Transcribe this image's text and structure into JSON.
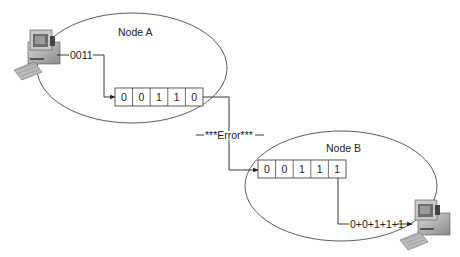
{
  "diagram": {
    "type": "data transmission parity/checksum illustration",
    "node_a": {
      "label": "Node A",
      "sent_bits_label": "0011",
      "frame_bits": [
        "0",
        "0",
        "1",
        "1",
        "0"
      ]
    },
    "link": {
      "label": "—***Error***—"
    },
    "node_b": {
      "label": "Node B",
      "frame_bits": [
        "0",
        "0",
        "1",
        "1",
        "1"
      ],
      "sum_label": "0+0+1+1+1"
    },
    "colors": {
      "line": "#222222",
      "background": "#ffffff"
    }
  }
}
